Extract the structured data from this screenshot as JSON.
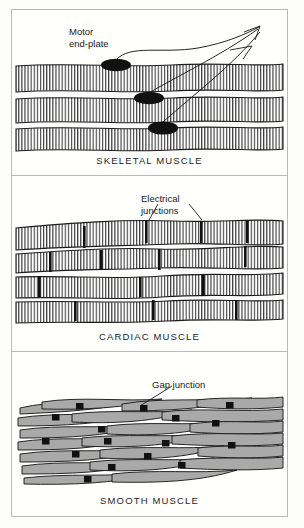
{
  "figure": {
    "background_color": "#fdfdfb",
    "frame_color": "#b9b9b6"
  },
  "panels": [
    {
      "id": "skeletal",
      "caption": "SKELETAL MUSCLE",
      "annotation": "Motor\nend-plate",
      "annotation_name": "Motor end-plate",
      "structure": "Three long parallel multinucleated fibers with dense cross striations",
      "fiber_count": 3,
      "feature_count": 3,
      "feature_color": "#111111",
      "fiber_fill": "#ffffff",
      "stripe_color": "#2b2b2b",
      "nerve_lines": 3,
      "nerve_origin": {
        "x": 247,
        "y": 18
      }
    },
    {
      "id": "cardiac",
      "caption": "CARDIAC MUSCLE",
      "annotation": "Electrical\njunctions",
      "annotation_name": "Electrical junctions",
      "structure": "Branching interconnected striated fibers joined end to end",
      "fiber_count": 5,
      "feature_count": 14,
      "feature_color": "#111111",
      "fiber_fill": "#ffffff",
      "stripe_color": "#2b2b2b",
      "leader_lines": 2
    },
    {
      "id": "smooth",
      "caption": "SMOOTH MUSCLE",
      "annotation": "Gap junction",
      "annotation_name": "Gap junction",
      "structure": "Overlapping spindle-shaped non-striated cells",
      "cell_count": 38,
      "feature_count": 16,
      "feature_color": "#111111",
      "cell_fill": "#a9a9a9",
      "cell_outline": "#1c1c1c",
      "leader_lines": 1
    }
  ],
  "colors": {
    "ink": "#1a1a1a",
    "stripe": "#2b2b2b",
    "smooth_fill": "#a9a9a9",
    "feature": "#111111",
    "border": "#b9b9b6",
    "paper": "#fffffd"
  }
}
